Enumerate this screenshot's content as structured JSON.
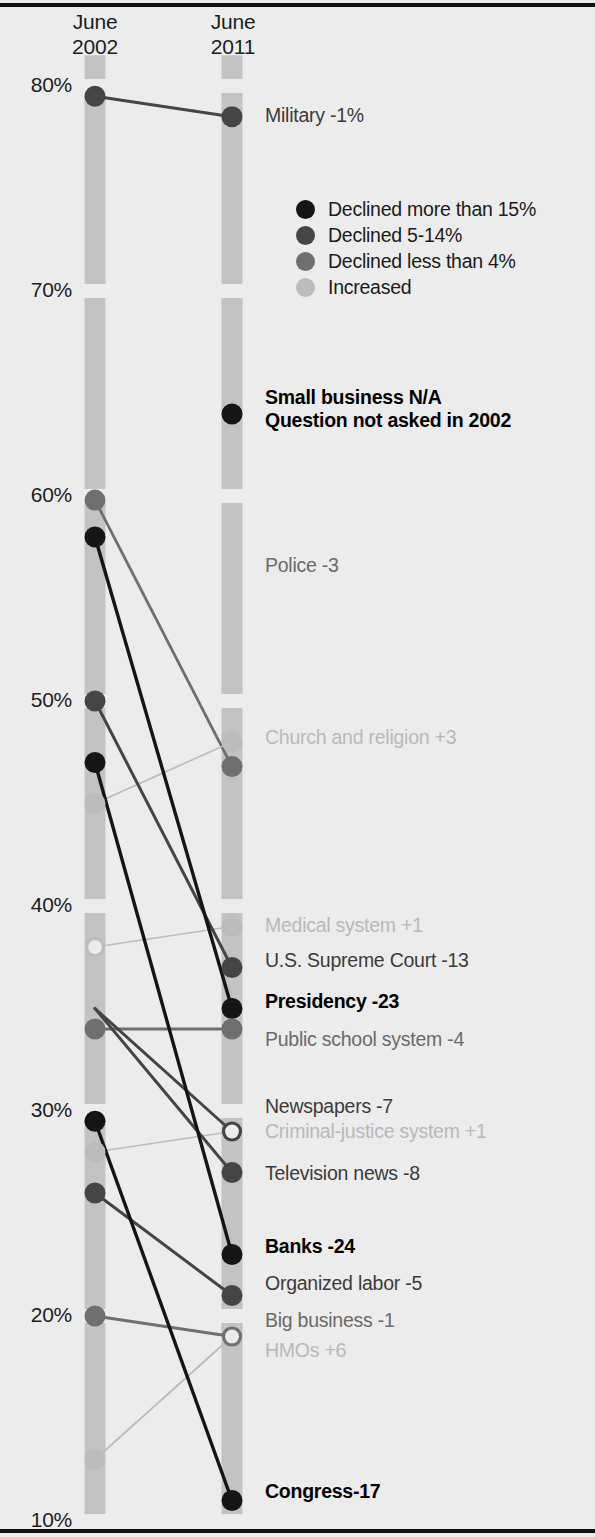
{
  "header": {
    "left_column": "June\n2002",
    "left_column_line1": "June",
    "left_column_line2": "2002",
    "right_column_line1": "June",
    "right_column_line2": "2011"
  },
  "axis": {
    "ticks": [
      "80%",
      "70%",
      "60%",
      "50%",
      "40%",
      "30%",
      "20%",
      "10%"
    ],
    "tick_values": [
      80,
      70,
      60,
      50,
      40,
      30,
      20,
      10
    ],
    "ymin": 10,
    "ymax": 82
  },
  "legend": {
    "items": [
      {
        "label": "Declined more than 15%",
        "color": "#151515",
        "key": "cat0"
      },
      {
        "label": "Declined 5-14%",
        "color": "#454545",
        "key": "cat1"
      },
      {
        "label": "Declined less than 4%",
        "color": "#6f6f6f",
        "key": "cat2"
      },
      {
        "label": "Increased",
        "color": "#bcbcbc",
        "key": "cat3"
      }
    ]
  },
  "colors": {
    "background": "#ececec",
    "column_bar": "#c3c3c3",
    "rule": "#111111",
    "cat0": "#151515",
    "cat1": "#454545",
    "cat2": "#6f6f6f",
    "cat3": "#bcbcbc"
  },
  "chart_data": {
    "type": "line",
    "subtype": "slope-chart",
    "title": "",
    "xlabel": "",
    "ylabel": "",
    "x": [
      "June 2002",
      "June 2011"
    ],
    "ylim": [
      10,
      82
    ],
    "ytick_labels": [
      "80%",
      "70%",
      "60%",
      "50%",
      "40%",
      "30%",
      "20%",
      "10%"
    ],
    "grid": false,
    "legend_position": "upper-right",
    "series": [
      {
        "name": "Military",
        "label": "Military -1%",
        "delta": "-1%",
        "v2002": 79.5,
        "v2011": 78.5,
        "category": "cat1",
        "label_y": 118,
        "dot_left": true,
        "dot_right": true,
        "hollow_left": false,
        "hollow_right": false
      },
      {
        "name": "Small business",
        "label": "Small business N/A",
        "sub": "Question not asked in 2002",
        "delta": "N/A",
        "v2002": null,
        "v2011": 64.0,
        "category": "cat0",
        "label_y": 400,
        "dot_left": false,
        "dot_right": true,
        "hollow_left": false,
        "hollow_right": false
      },
      {
        "name": "Police",
        "label": "Police -3",
        "delta": "-3",
        "v2002": 59.8,
        "v2011": 46.8,
        "category": "cat2",
        "label_y": 568,
        "dot_left": true,
        "dot_right": true,
        "hollow_left": false,
        "hollow_right": false
      },
      {
        "name": "Church and religion",
        "label": "Church and religion +3",
        "delta": "+3",
        "v2002": 45.0,
        "v2011": 48.0,
        "category": "cat3",
        "label_y": 740,
        "dot_left": true,
        "dot_right": true,
        "hollow_left": false,
        "hollow_right": false
      },
      {
        "name": "Medical system",
        "label": "Medical system +1",
        "delta": "+1",
        "v2002": 38.0,
        "v2011": 39.0,
        "category": "cat3",
        "label_y": 928,
        "dot_left": true,
        "dot_right": true,
        "hollow_left": true,
        "hollow_right": false
      },
      {
        "name": "U.S. Supreme Court",
        "label": "U.S. Supreme Court -13",
        "delta": "-13",
        "v2002": 50.0,
        "v2011": 37.0,
        "category": "cat1",
        "label_y": 963,
        "dot_left": true,
        "dot_right": true,
        "hollow_left": false,
        "hollow_right": false
      },
      {
        "name": "Presidency",
        "label": "Presidency -23",
        "delta": "-23",
        "v2002": 58.0,
        "v2011": 35.0,
        "category": "cat0",
        "label_y": 1004,
        "dot_left": true,
        "dot_right": true,
        "hollow_left": false,
        "hollow_right": false
      },
      {
        "name": "Public school system",
        "label": "Public school system -4",
        "delta": "-4",
        "v2002": 34.0,
        "v2011": 34.0,
        "category": "cat2",
        "label_y": 1042,
        "dot_left": true,
        "dot_right": true,
        "hollow_left": false,
        "hollow_right": false
      },
      {
        "name": "Newspapers",
        "label": "Newspapers -7",
        "delta": "-7",
        "v2002": 35.0,
        "v2011": 29.0,
        "category": "cat1",
        "label_y": 1109,
        "dot_left": false,
        "dot_right": true,
        "hollow_left": false,
        "hollow_right": true
      },
      {
        "name": "Criminal-justice system",
        "label": "Criminal-justice system +1",
        "delta": "+1",
        "v2002": 28.0,
        "v2011": 29.0,
        "category": "cat3",
        "label_y": 1134,
        "dot_left": true,
        "dot_right": false,
        "hollow_left": false,
        "hollow_right": false
      },
      {
        "name": "Television news",
        "label": "Television news -8",
        "delta": "-8",
        "v2002": 35.0,
        "v2011": 27.0,
        "category": "cat1",
        "label_y": 1176,
        "dot_left": false,
        "dot_right": true,
        "hollow_left": false,
        "hollow_right": false
      },
      {
        "name": "Banks",
        "label": "Banks -24",
        "delta": "-24",
        "v2002": 47.0,
        "v2011": 23.0,
        "category": "cat0",
        "label_y": 1249,
        "dot_left": true,
        "dot_right": true,
        "hollow_left": false,
        "hollow_right": false
      },
      {
        "name": "Organized labor",
        "label": "Organized labor -5",
        "delta": "-5",
        "v2002": 26.0,
        "v2011": 21.0,
        "category": "cat1",
        "label_y": 1286,
        "dot_left": true,
        "dot_right": true,
        "hollow_left": false,
        "hollow_right": false
      },
      {
        "name": "Big business",
        "label": "Big business -1",
        "delta": "-1",
        "v2002": 20.0,
        "v2011": 19.0,
        "category": "cat2",
        "label_y": 1323,
        "dot_left": true,
        "dot_right": true,
        "hollow_left": false,
        "hollow_right": true
      },
      {
        "name": "HMOs",
        "label": "HMOs +6",
        "delta": "+6",
        "v2002": 13.0,
        "v2011": 19.0,
        "category": "cat3",
        "label_y": 1353,
        "dot_left": true,
        "dot_right": false,
        "hollow_left": false,
        "hollow_right": false
      },
      {
        "name": "Congress",
        "label": "Congress-17",
        "delta": "-17",
        "v2002": 29.5,
        "v2011": 11.0,
        "category": "cat0",
        "label_y": 1494,
        "dot_left": true,
        "dot_right": true,
        "hollow_left": false,
        "hollow_right": false
      }
    ]
  }
}
